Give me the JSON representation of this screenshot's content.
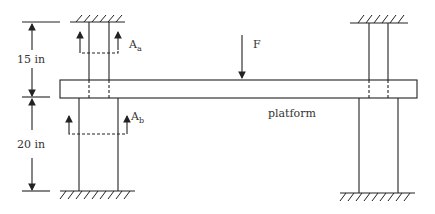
{
  "diagram": {
    "labels": {
      "force": "F",
      "upper_section": "A",
      "upper_section_sub": "a",
      "lower_section": "A",
      "lower_section_sub": "b",
      "platform": "platform",
      "upper_dimension": "15 in",
      "lower_dimension": "20 in"
    },
    "colors": {
      "line": "#222222",
      "text": "#333333",
      "background": "#ffffff"
    }
  }
}
